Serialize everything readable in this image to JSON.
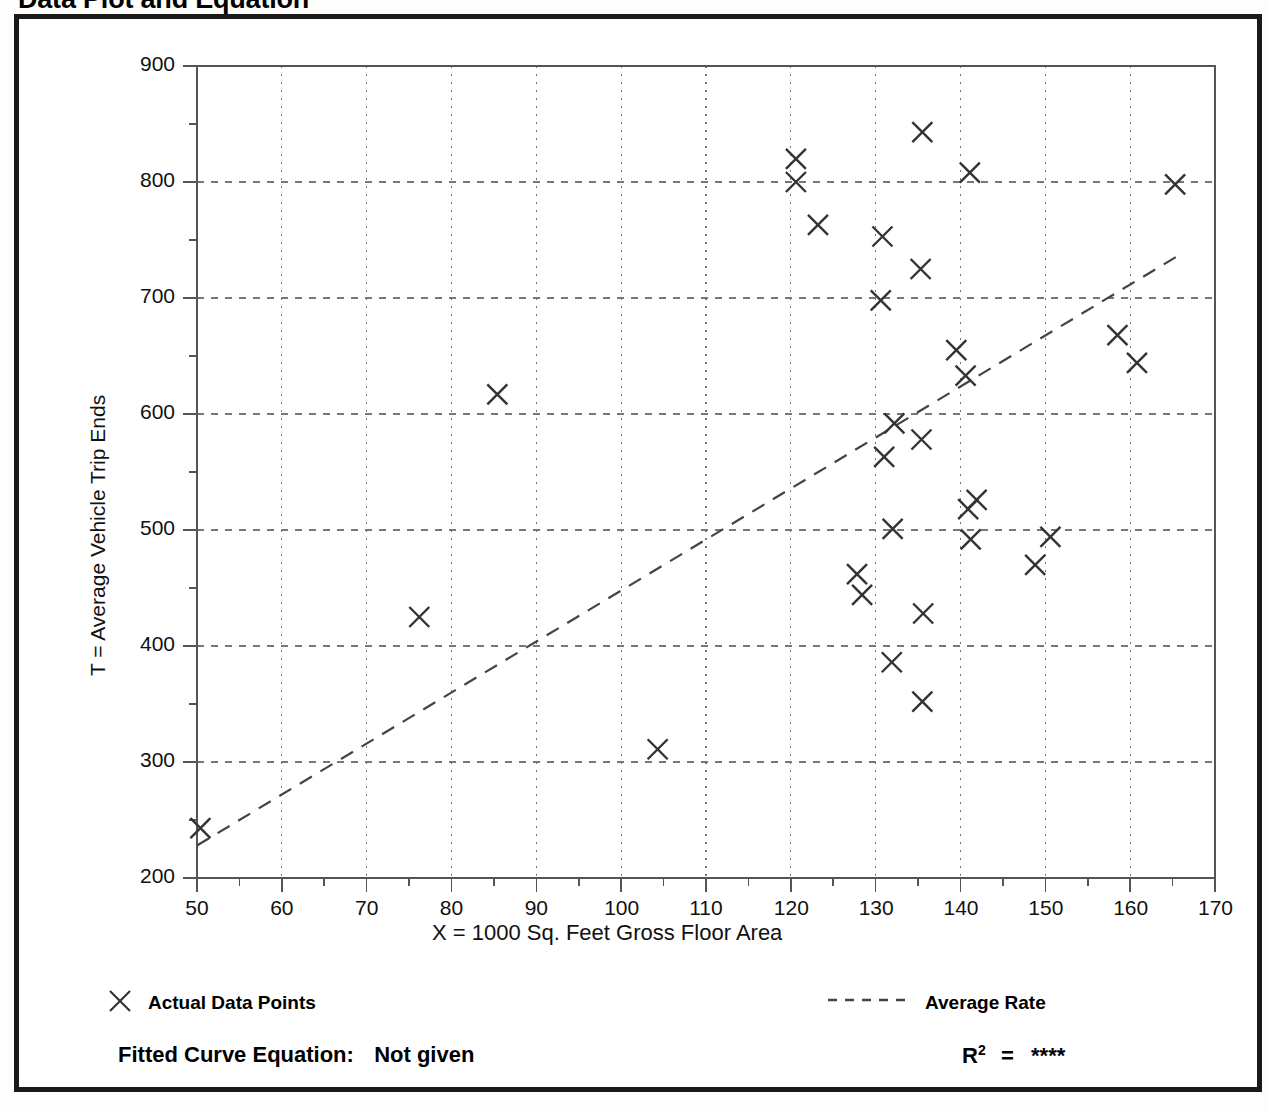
{
  "page": {
    "title": "Data Plot and Equation"
  },
  "chart_data": {
    "type": "scatter",
    "title": "Data Plot and Equation",
    "xlabel": "X = 1000 Sq. Feet Gross Floor Area",
    "ylabel": "T = Average Vehicle Trip Ends",
    "xlim": [
      50,
      170
    ],
    "ylim": [
      200,
      900
    ],
    "xticks": [
      50,
      60,
      70,
      80,
      90,
      100,
      110,
      120,
      130,
      140,
      150,
      160,
      170
    ],
    "yticks": [
      200,
      300,
      400,
      500,
      600,
      700,
      800,
      900
    ],
    "x_minor_step": 5,
    "y_minor_step": 50,
    "grid": true,
    "grid_style": "dotted",
    "legend_position": "below-plot",
    "series": [
      {
        "name": "Actual Data Points",
        "marker": "x",
        "points": [
          [
            50.4,
            243
          ],
          [
            76.2,
            425
          ],
          [
            85.4,
            617
          ],
          [
            104.3,
            311
          ],
          [
            120.6,
            820
          ],
          [
            120.6,
            800
          ],
          [
            123.2,
            763
          ],
          [
            127.8,
            462
          ],
          [
            128.4,
            444
          ],
          [
            130.8,
            753
          ],
          [
            130.6,
            698
          ],
          [
            131.0,
            563
          ],
          [
            132.2,
            592
          ],
          [
            132.0,
            501
          ],
          [
            131.9,
            386
          ],
          [
            135.5,
            843
          ],
          [
            135.3,
            725
          ],
          [
            135.4,
            578
          ],
          [
            135.6,
            428
          ],
          [
            135.5,
            352
          ],
          [
            139.5,
            655
          ],
          [
            140.6,
            633
          ],
          [
            141.1,
            808
          ],
          [
            140.9,
            518
          ],
          [
            141.9,
            526
          ],
          [
            141.2,
            492
          ],
          [
            148.8,
            470
          ],
          [
            150.6,
            494
          ],
          [
            158.5,
            668
          ],
          [
            160.8,
            644
          ],
          [
            165.3,
            798
          ]
        ]
      }
    ],
    "fit_line": {
      "name": "Average Rate",
      "style": "dashed",
      "endpoints": [
        [
          50,
          228
        ],
        [
          166,
          738
        ]
      ]
    }
  },
  "legend": {
    "marker_label": "Actual Data Points",
    "line_label": "Average Rate",
    "marker_symbol": "x",
    "line_symbol": "dashed-line"
  },
  "footer": {
    "equation_label": "Fitted Curve Equation:",
    "equation_value": "Not given",
    "r2_label": "R",
    "r2_exponent": "2",
    "r2_eq": "=",
    "r2_value": "****"
  },
  "colors": {
    "frame": "#1a1a1a",
    "axis": "#555555",
    "grid": "#777777",
    "marker": "#333333",
    "fit_line": "#444444",
    "text": "#111111"
  }
}
